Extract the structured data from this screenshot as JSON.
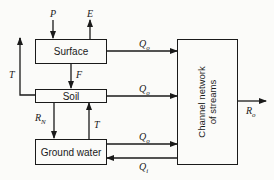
{
  "boxes": {
    "surface": "Surface",
    "soil": "Soil",
    "groundwater": "Ground water",
    "channel_line1": "Channel network",
    "channel_line2": "of streams"
  },
  "labels": {
    "precipitation": "P",
    "evaporation": "E",
    "transpiration_left": "T",
    "infiltration": "F",
    "surface_outflow": "Q",
    "surface_outflow_sub": "o",
    "soil_outflow": "Q",
    "soil_outflow_sub": "o",
    "recharge": "R",
    "recharge_sub": "N",
    "capillary_rise": "T",
    "groundwater_outflow": "Q",
    "groundwater_outflow_sub": "o",
    "channel_inflow": "Q",
    "channel_inflow_sub": "i",
    "runoff": "R",
    "runoff_sub": "o"
  }
}
